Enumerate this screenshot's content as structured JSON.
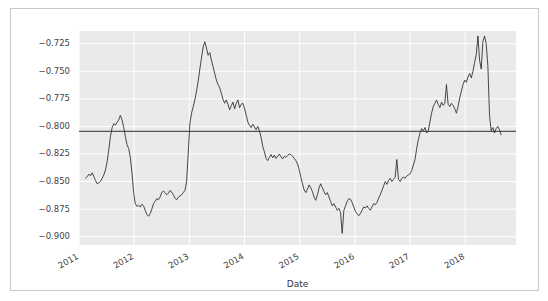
{
  "figure": {
    "background": "#ffffff",
    "border_color": "#c8c8c8",
    "plot_background": "#eaeaea",
    "grid_color": "#ffffff"
  },
  "chart_data": {
    "type": "line",
    "title": "",
    "xlabel": "Date",
    "ylabel": "",
    "xlim": [
      "2011-02-01",
      "2018-10-01"
    ],
    "ylim": [
      -0.9075,
      -0.7135
    ],
    "grid": true,
    "legend": null,
    "line_color": "#333333",
    "line_width": 0.9,
    "xticks": [
      "2011",
      "2012",
      "2013",
      "2014",
      "2015",
      "2016",
      "2017",
      "2018"
    ],
    "xtick_rotation": 30,
    "yticks": [
      -0.725,
      -0.75,
      -0.775,
      -0.8,
      -0.825,
      -0.85,
      -0.875,
      -0.9
    ],
    "ytick_labels": [
      "−0.725",
      "−0.750",
      "−0.775",
      "−0.800",
      "−0.825",
      "−0.850",
      "−0.875",
      "−0.900"
    ],
    "annotations": [
      {
        "type": "hline",
        "name": "mean-reference-line",
        "y": -0.8045,
        "color": "#555555",
        "width": 1.4
      }
    ],
    "series": [
      {
        "name": "value",
        "x": [
          2011.12,
          2011.15,
          2011.18,
          2011.21,
          2011.24,
          2011.27,
          2011.3,
          2011.33,
          2011.36,
          2011.39,
          2011.42,
          2011.45,
          2011.48,
          2011.51,
          2011.54,
          2011.57,
          2011.6,
          2011.63,
          2011.66,
          2011.69,
          2011.72,
          2011.75,
          2011.78,
          2011.81,
          2011.84,
          2011.87,
          2011.9,
          2011.93,
          2011.96,
          2011.99,
          2012.02,
          2012.05,
          2012.08,
          2012.11,
          2012.14,
          2012.17,
          2012.2,
          2012.23,
          2012.26,
          2012.29,
          2012.32,
          2012.35,
          2012.38,
          2012.41,
          2012.44,
          2012.47,
          2012.5,
          2012.53,
          2012.56,
          2012.59,
          2012.62,
          2012.65,
          2012.68,
          2012.71,
          2012.74,
          2012.77,
          2012.8,
          2012.83,
          2012.86,
          2012.89,
          2012.92,
          2012.95,
          2012.98,
          2013.01,
          2013.04,
          2013.07,
          2013.1,
          2013.13,
          2013.16,
          2013.19,
          2013.22,
          2013.25,
          2013.28,
          2013.31,
          2013.34,
          2013.37,
          2013.4,
          2013.43,
          2013.46,
          2013.49,
          2013.52,
          2013.55,
          2013.58,
          2013.61,
          2013.64,
          2013.67,
          2013.7,
          2013.73,
          2013.76,
          2013.79,
          2013.82,
          2013.85,
          2013.88,
          2013.91,
          2013.94,
          2013.97,
          2014.0,
          2014.03,
          2014.06,
          2014.09,
          2014.12,
          2014.15,
          2014.18,
          2014.21,
          2014.24,
          2014.27,
          2014.3,
          2014.33,
          2014.36,
          2014.39,
          2014.42,
          2014.45,
          2014.48,
          2014.51,
          2014.54,
          2014.57,
          2014.6,
          2014.63,
          2014.66,
          2014.69,
          2014.72,
          2014.75,
          2014.78,
          2014.81,
          2014.84,
          2014.87,
          2014.9,
          2014.93,
          2014.96,
          2014.99,
          2015.02,
          2015.05,
          2015.08,
          2015.11,
          2015.14,
          2015.17,
          2015.2,
          2015.23,
          2015.26,
          2015.29,
          2015.32,
          2015.35,
          2015.38,
          2015.41,
          2015.44,
          2015.47,
          2015.5,
          2015.53,
          2015.56,
          2015.59,
          2015.62,
          2015.65,
          2015.68,
          2015.71,
          2015.74,
          2015.77,
          2015.8,
          2015.83,
          2015.86,
          2015.89,
          2015.92,
          2015.95,
          2015.98,
          2016.01,
          2016.04,
          2016.07,
          2016.1,
          2016.13,
          2016.16,
          2016.19,
          2016.22,
          2016.25,
          2016.28,
          2016.31,
          2016.34,
          2016.37,
          2016.4,
          2016.43,
          2016.46,
          2016.49,
          2016.52,
          2016.55,
          2016.58,
          2016.61,
          2016.64,
          2016.67,
          2016.7,
          2016.73,
          2016.76,
          2016.79,
          2016.82,
          2016.85,
          2016.88,
          2016.91,
          2016.94,
          2016.97,
          2017.0,
          2017.03,
          2017.06,
          2017.09,
          2017.12,
          2017.15,
          2017.18,
          2017.21,
          2017.24,
          2017.27,
          2017.3,
          2017.33,
          2017.36,
          2017.39,
          2017.42,
          2017.45,
          2017.48,
          2017.51,
          2017.54,
          2017.57,
          2017.6,
          2017.63,
          2017.66,
          2017.69,
          2017.72,
          2017.75,
          2017.78,
          2017.81,
          2017.84,
          2017.87,
          2017.9,
          2017.93,
          2017.96,
          2017.99,
          2018.02,
          2018.05,
          2018.08,
          2018.11,
          2018.14,
          2018.17,
          2018.2,
          2018.23,
          2018.26,
          2018.29,
          2018.32,
          2018.35,
          2018.38,
          2018.41,
          2018.44,
          2018.47,
          2018.5,
          2018.53,
          2018.56,
          2018.59,
          2018.62,
          2018.65
        ],
        "y": [
          -0.8468,
          -0.8455,
          -0.8432,
          -0.8448,
          -0.842,
          -0.8455,
          -0.849,
          -0.852,
          -0.8512,
          -0.8498,
          -0.847,
          -0.844,
          -0.8395,
          -0.832,
          -0.821,
          -0.809,
          -0.8012,
          -0.7975,
          -0.7988,
          -0.7962,
          -0.794,
          -0.79,
          -0.794,
          -0.801,
          -0.809,
          -0.8165,
          -0.82,
          -0.828,
          -0.842,
          -0.86,
          -0.87,
          -0.8725,
          -0.8715,
          -0.873,
          -0.8705,
          -0.872,
          -0.876,
          -0.88,
          -0.8815,
          -0.879,
          -0.875,
          -0.87,
          -0.868,
          -0.8655,
          -0.8665,
          -0.864,
          -0.86,
          -0.8585,
          -0.86,
          -0.862,
          -0.8605,
          -0.858,
          -0.8595,
          -0.862,
          -0.865,
          -0.8665,
          -0.864,
          -0.863,
          -0.862,
          -0.86,
          -0.858,
          -0.85,
          -0.824,
          -0.797,
          -0.788,
          -0.782,
          -0.776,
          -0.768,
          -0.759,
          -0.748,
          -0.738,
          -0.728,
          -0.7232,
          -0.729,
          -0.7355,
          -0.733,
          -0.74,
          -0.746,
          -0.752,
          -0.758,
          -0.762,
          -0.765,
          -0.77,
          -0.7755,
          -0.779,
          -0.776,
          -0.78,
          -0.785,
          -0.7812,
          -0.778,
          -0.784,
          -0.779,
          -0.776,
          -0.783,
          -0.78,
          -0.779,
          -0.7835,
          -0.79,
          -0.796,
          -0.799,
          -0.801,
          -0.798,
          -0.8005,
          -0.803,
          -0.8,
          -0.804,
          -0.81,
          -0.818,
          -0.823,
          -0.829,
          -0.831,
          -0.828,
          -0.8255,
          -0.8285,
          -0.826,
          -0.829,
          -0.827,
          -0.825,
          -0.8275,
          -0.8295,
          -0.827,
          -0.828,
          -0.8265,
          -0.825,
          -0.8255,
          -0.827,
          -0.829,
          -0.831,
          -0.834,
          -0.839,
          -0.846,
          -0.852,
          -0.8575,
          -0.86,
          -0.857,
          -0.853,
          -0.8555,
          -0.859,
          -0.864,
          -0.867,
          -0.862,
          -0.856,
          -0.852,
          -0.8555,
          -0.859,
          -0.862,
          -0.86,
          -0.864,
          -0.868,
          -0.872,
          -0.87,
          -0.873,
          -0.876,
          -0.8742,
          -0.878,
          -0.897,
          -0.876,
          -0.872,
          -0.868,
          -0.8655,
          -0.866,
          -0.869,
          -0.873,
          -0.877,
          -0.879,
          -0.881,
          -0.879,
          -0.876,
          -0.873,
          -0.874,
          -0.872,
          -0.8745,
          -0.876,
          -0.873,
          -0.87,
          -0.871,
          -0.869,
          -0.865,
          -0.862,
          -0.858,
          -0.854,
          -0.85,
          -0.8525,
          -0.849,
          -0.847,
          -0.85,
          -0.848,
          -0.846,
          -0.83,
          -0.848,
          -0.85,
          -0.847,
          -0.846,
          -0.847,
          -0.845,
          -0.844,
          -0.843,
          -0.84,
          -0.835,
          -0.83,
          -0.82,
          -0.812,
          -0.806,
          -0.802,
          -0.804,
          -0.801,
          -0.806,
          -0.804,
          -0.796,
          -0.788,
          -0.782,
          -0.779,
          -0.776,
          -0.78,
          -0.783,
          -0.778,
          -0.781,
          -0.779,
          -0.762,
          -0.78,
          -0.782,
          -0.779,
          -0.781,
          -0.784,
          -0.788,
          -0.782,
          -0.774,
          -0.768,
          -0.762,
          -0.758,
          -0.76,
          -0.755,
          -0.752,
          -0.756,
          -0.75,
          -0.742,
          -0.735,
          -0.718,
          -0.74,
          -0.748,
          -0.723,
          -0.718,
          -0.725,
          -0.745,
          -0.79,
          -0.804,
          -0.801,
          -0.806,
          -0.802,
          -0.8,
          -0.803,
          -0.8075
        ]
      }
    ]
  }
}
